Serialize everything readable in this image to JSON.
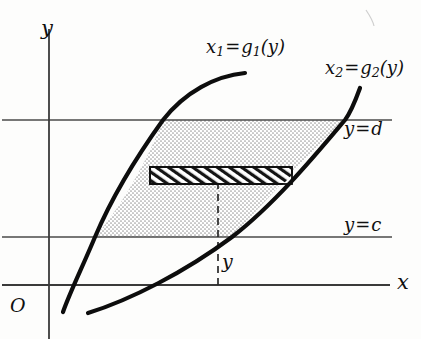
{
  "figure": {
    "kind": "math-diagram",
    "background_color": "#fdfdfc",
    "axes": {
      "x_label": "x",
      "y_label": "y",
      "origin_label": "O",
      "axis_color": "#3a3a3a"
    },
    "curves": [
      {
        "id": "curve-left",
        "label_x": "x",
        "label_x_sub": "1",
        "label_fn": "g",
        "label_fn_sub": "1",
        "label_arg": "(y)",
        "label_full": "x1 = g1(y)",
        "color": "#0d0d0d"
      },
      {
        "id": "curve-right",
        "label_x": "x",
        "label_x_sub": "2",
        "label_fn": "g",
        "label_fn_sub": "2",
        "label_arg": "(y)",
        "label_full": "x2 = g2(y)",
        "color": "#0d0d0d"
      }
    ],
    "horizontal_lines": [
      {
        "id": "line-d",
        "label_var": "y",
        "label_eq": "=",
        "label_val": "d",
        "label_full": "y = d"
      },
      {
        "id": "line-c",
        "label_var": "y",
        "label_eq": "=",
        "label_val": "c",
        "label_full": "y = c"
      }
    ],
    "region": {
      "id": "shaded-region",
      "fill_color": "#e0e0e0",
      "note": "stippled area between the two curves from y=c to y=d"
    },
    "strip": {
      "id": "hatched-strip",
      "label": "y",
      "hatch_color": "#111111",
      "note": "thin horizontal rectangular element spanning the region at height y"
    },
    "dashed_line": {
      "id": "dashed-ordinate",
      "label": "y"
    }
  }
}
